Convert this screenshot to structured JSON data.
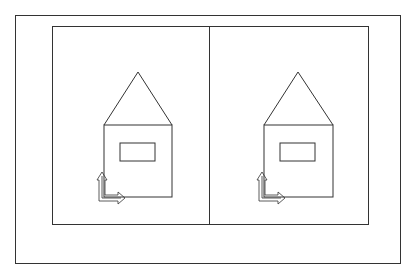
{
  "diagram": {
    "type": "cad-viewports",
    "colors": {
      "line": "#333333",
      "background": "#ffffff"
    },
    "viewports": [
      {
        "id": "left",
        "contents": [
          "house-outline",
          "roof",
          "window",
          "ucs-icon"
        ]
      },
      {
        "id": "right",
        "contents": [
          "house-outline",
          "roof",
          "window",
          "ucs-icon"
        ]
      }
    ]
  }
}
